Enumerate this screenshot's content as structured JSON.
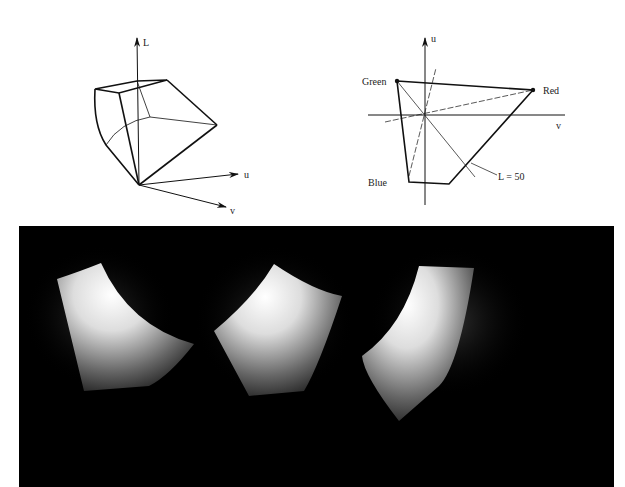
{
  "left_diagram": {
    "title": "3D color gamut solid in Luv space",
    "axes": {
      "L": "L",
      "u": "u",
      "v": "v"
    }
  },
  "right_diagram": {
    "title": "Gamut cross-section in u-v plane",
    "axes": {
      "u": "u",
      "v": "v"
    },
    "vertices": {
      "green": "Green",
      "red": "Red",
      "blue": "Blue"
    },
    "annotation": "L = 50"
  },
  "photo_panel": {
    "description": "Three rendered views of gamut solid on black background",
    "count": 3,
    "background": "#000000"
  }
}
